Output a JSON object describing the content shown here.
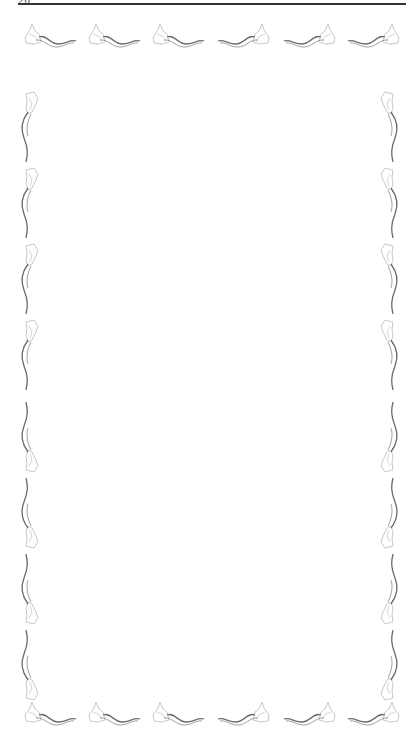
{
  "page": {
    "header": {
      "page_number": "20"
    },
    "border": {
      "style": "floral vine ornaments",
      "stroke_color": "#6b6b6b",
      "petal_color": "#c8c8c8",
      "top_row": {
        "count": 6,
        "orientation": [
          "left",
          "left",
          "left",
          "right",
          "right",
          "right"
        ]
      },
      "bottom_row": {
        "count": 6,
        "orientation": [
          "left",
          "left",
          "left",
          "right",
          "right",
          "right"
        ]
      },
      "left_column": {
        "count": 8,
        "orientation": [
          "up",
          "up",
          "up",
          "up",
          "down",
          "down",
          "down",
          "down"
        ]
      },
      "right_column": {
        "count": 8,
        "orientation": [
          "up",
          "up",
          "up",
          "up",
          "down",
          "down",
          "down",
          "down"
        ]
      }
    },
    "body_text": ""
  }
}
